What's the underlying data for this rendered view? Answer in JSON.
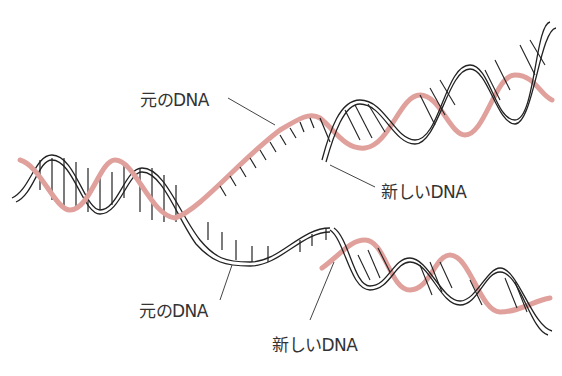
{
  "diagram": {
    "colors": {
      "original_strand": "#e0a09c",
      "new_strand": "#222222",
      "leader_line": "#444444",
      "text": "#333333"
    },
    "labels": {
      "top_original": "元のDNA",
      "top_new": "新しいDNA",
      "bottom_original": "元のDNA",
      "bottom_new": "新しいDNA"
    }
  }
}
